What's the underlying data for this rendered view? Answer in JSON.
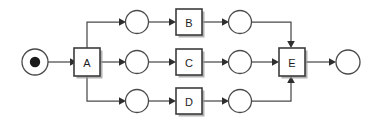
{
  "diagram": {
    "kind": "petri-net",
    "title": "",
    "canvas": {
      "width": 372,
      "height": 124,
      "background": "#ffffff"
    },
    "colors": {
      "stroke": "#4a4a4a",
      "box_stroke": "#3c3c3c",
      "token": "#1a1a1a",
      "shadow": "#9a9a9a",
      "label": "#1d1d1d",
      "arrow": "#2e2e2e"
    },
    "rows": {
      "top_y": 22,
      "middle_y": 62,
      "bottom_y": 101
    },
    "places": [
      {
        "id": "p-start",
        "label": "",
        "cx": 35,
        "cy": 62,
        "r": 13,
        "tokens": 1,
        "token_r": 5.2
      },
      {
        "id": "p-top-in",
        "label": "",
        "cx": 137,
        "cy": 22,
        "r": 11.5,
        "tokens": 0
      },
      {
        "id": "p-top-out",
        "label": "",
        "cx": 240,
        "cy": 22,
        "r": 11.5,
        "tokens": 0
      },
      {
        "id": "p-mid-in",
        "label": "",
        "cx": 137,
        "cy": 62,
        "r": 11.5,
        "tokens": 0
      },
      {
        "id": "p-mid-out",
        "label": "",
        "cx": 240,
        "cy": 62,
        "r": 11.5,
        "tokens": 0
      },
      {
        "id": "p-bot-in",
        "label": "",
        "cx": 137,
        "cy": 101,
        "r": 11.5,
        "tokens": 0
      },
      {
        "id": "p-bot-out",
        "label": "",
        "cx": 240,
        "cy": 101,
        "r": 11.5,
        "tokens": 0
      },
      {
        "id": "p-end",
        "label": "",
        "cx": 348,
        "cy": 62,
        "r": 12,
        "tokens": 0
      }
    ],
    "transitions": [
      {
        "id": "t-a",
        "label": "A",
        "x": 74,
        "y": 48,
        "w": 26,
        "h": 28
      },
      {
        "id": "t-b",
        "label": "B",
        "x": 176,
        "y": 9,
        "w": 26,
        "h": 26
      },
      {
        "id": "t-c",
        "label": "C",
        "x": 176,
        "y": 49,
        "w": 26,
        "h": 26
      },
      {
        "id": "t-d",
        "label": "D",
        "x": 176,
        "y": 88,
        "w": 26,
        "h": 26
      },
      {
        "id": "t-e",
        "label": "E",
        "x": 279,
        "y": 48,
        "w": 26,
        "h": 28
      }
    ],
    "arcs": [
      {
        "id": "arc-start-a",
        "from": "p-start",
        "to": "t-a",
        "points": "48,62 70,62",
        "head": {
          "x": 74,
          "y": 62,
          "dir": "right"
        }
      },
      {
        "id": "arc-a-top",
        "from": "t-a",
        "to": "p-top-in",
        "points": "87,48 87,22 121,22",
        "head": {
          "x": 125.5,
          "y": 22,
          "dir": "right"
        }
      },
      {
        "id": "arc-a-mid",
        "from": "t-a",
        "to": "p-mid-in",
        "points": "100,62 121,62",
        "head": {
          "x": 125.5,
          "y": 62,
          "dir": "right"
        }
      },
      {
        "id": "arc-a-bot",
        "from": "t-a",
        "to": "p-bot-in",
        "points": "87,76 87,101 121,101",
        "head": {
          "x": 125.5,
          "y": 101,
          "dir": "right"
        }
      },
      {
        "id": "arc-topin-b",
        "from": "p-top-in",
        "to": "t-b",
        "points": "148.5,22 172,22",
        "head": {
          "x": 176,
          "y": 22,
          "dir": "right"
        }
      },
      {
        "id": "arc-midin-c",
        "from": "p-mid-in",
        "to": "t-c",
        "points": "148.5,62 172,62",
        "head": {
          "x": 176,
          "y": 62,
          "dir": "right"
        }
      },
      {
        "id": "arc-botin-d",
        "from": "p-bot-in",
        "to": "t-d",
        "points": "148.5,101 172,101",
        "head": {
          "x": 176,
          "y": 101,
          "dir": "right"
        }
      },
      {
        "id": "arc-b-topout",
        "from": "t-b",
        "to": "p-top-out",
        "points": "202,22 224,22",
        "head": {
          "x": 228.5,
          "y": 22,
          "dir": "right"
        }
      },
      {
        "id": "arc-c-midout",
        "from": "t-c",
        "to": "p-mid-out",
        "points": "202,62 224,62",
        "head": {
          "x": 228.5,
          "y": 62,
          "dir": "right"
        }
      },
      {
        "id": "arc-d-botout",
        "from": "t-d",
        "to": "p-bot-out",
        "points": "202,101 224,101",
        "head": {
          "x": 228.5,
          "y": 101,
          "dir": "right"
        }
      },
      {
        "id": "arc-topout-e",
        "from": "p-top-out",
        "to": "t-e",
        "points": "251.5,22 291,22 291,44",
        "head": {
          "x": 291,
          "y": 48,
          "dir": "down"
        }
      },
      {
        "id": "arc-midout-e",
        "from": "p-mid-out",
        "to": "t-e",
        "points": "251.5,62 275,62",
        "head": {
          "x": 279,
          "y": 62,
          "dir": "right"
        }
      },
      {
        "id": "arc-botout-e",
        "from": "p-bot-out",
        "to": "t-e",
        "points": "251.5,101 291,101 291,80",
        "head": {
          "x": 291,
          "y": 76,
          "dir": "up"
        }
      },
      {
        "id": "arc-e-end",
        "from": "t-e",
        "to": "p-end",
        "points": "305,62 332,62",
        "head": {
          "x": 336,
          "y": 62,
          "dir": "right"
        }
      }
    ]
  }
}
